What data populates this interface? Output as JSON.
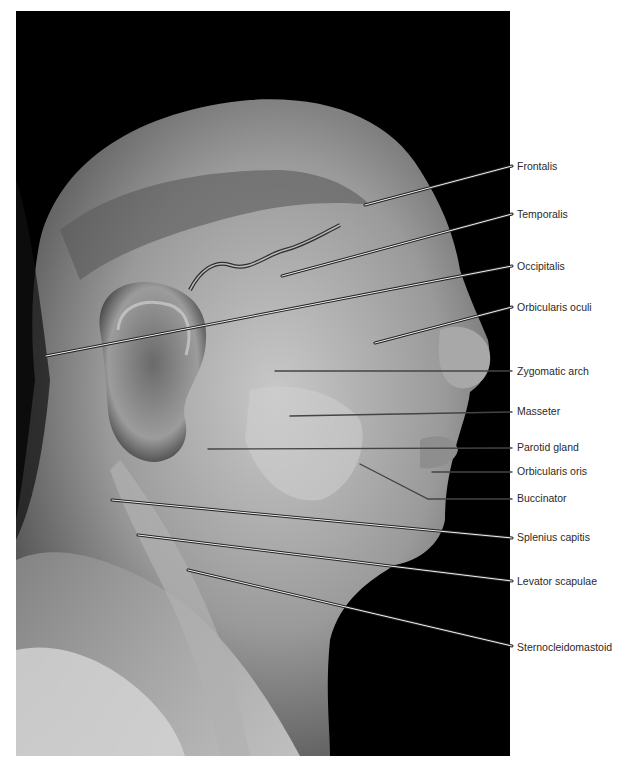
{
  "figure": {
    "background_color": "#000000",
    "page_color": "#ffffff"
  },
  "labels": [
    {
      "id": "frontalis",
      "text": "Frontalis",
      "y": 165,
      "line": {
        "x1": 365,
        "y1": 205,
        "x2": 512,
        "y2": 166
      }
    },
    {
      "id": "temporalis",
      "text": "Temporalis",
      "y": 213,
      "line": {
        "x1": 282,
        "y1": 276,
        "x2": 512,
        "y2": 214
      }
    },
    {
      "id": "occipitalis",
      "text": "Occipitalis",
      "y": 265,
      "line": {
        "x1": 46,
        "y1": 356,
        "x2": 512,
        "y2": 266
      }
    },
    {
      "id": "orbicularis-oculi",
      "text": "Orbicularis oculi",
      "y": 306,
      "line": {
        "x1": 375,
        "y1": 343,
        "x2": 512,
        "y2": 307
      }
    },
    {
      "id": "zygomatic-arch",
      "text": "Zygomatic arch",
      "y": 370,
      "line": {
        "x1": 275,
        "y1": 371,
        "x2": 512,
        "y2": 371
      }
    },
    {
      "id": "masseter",
      "text": "Masseter",
      "y": 410,
      "line": {
        "x1": 290,
        "y1": 416,
        "x2": 512,
        "y2": 412
      }
    },
    {
      "id": "parotid-gland",
      "text": "Parotid gland",
      "y": 446,
      "line": {
        "x1": 208,
        "y1": 449,
        "x2": 512,
        "y2": 448
      }
    },
    {
      "id": "orbicularis-oris",
      "text": "Orbicularis oris",
      "y": 470,
      "line": {
        "x1": 432,
        "y1": 472,
        "x2": 512,
        "y2": 472
      }
    },
    {
      "id": "buccinator",
      "text": "Buccinator",
      "y": 497,
      "line": {
        "x1": 360,
        "y1": 464,
        "x2": 428,
        "y2": 499,
        "x3": 512,
        "y3": 499
      }
    },
    {
      "id": "splenius-capitis",
      "text": "Splenius capitis",
      "y": 536,
      "line": {
        "x1": 112,
        "y1": 500,
        "x2": 512,
        "y2": 538
      }
    },
    {
      "id": "levator-scapulae",
      "text": "Levator scapulae",
      "y": 580,
      "line": {
        "x1": 138,
        "y1": 535,
        "x2": 512,
        "y2": 581
      }
    },
    {
      "id": "sternocleidomastoid",
      "text": "Sternocleidomastoid",
      "y": 646,
      "line": {
        "x1": 188,
        "y1": 570,
        "x2": 512,
        "y2": 646
      }
    }
  ]
}
